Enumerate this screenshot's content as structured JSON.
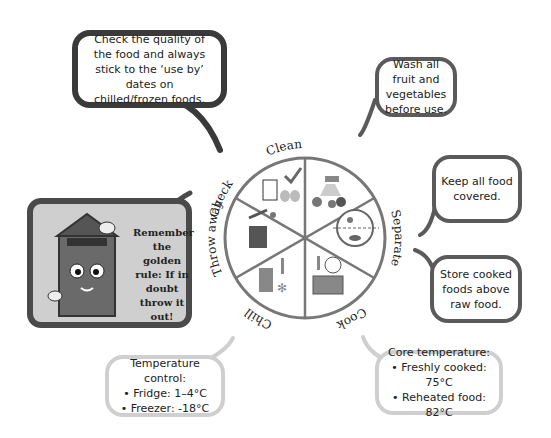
{
  "wheel": {
    "segments": [
      {
        "label": "Check",
        "icon": "milk-eggs-check-icon"
      },
      {
        "label": "Clean",
        "icon": "tap-vegetables-icon"
      },
      {
        "label": "Separate",
        "icon": "separated-plate-icon"
      },
      {
        "label": "Cook",
        "icon": "microwave-clock-thermometer-icon"
      },
      {
        "label": "Chill",
        "icon": "fridge-snowflake-thermometer-icon"
      },
      {
        "label": "Throw away",
        "icon": "bin-icon"
      }
    ]
  },
  "bubbles": {
    "check": "Check the quality of the food and always stick to the ‘use by’ dates on chilled/frozen foods.",
    "clean": "Wash all fruit and vegetables before use.",
    "separate_1": "Keep all food covered.",
    "separate_2": "Store cooked foods above raw food.",
    "chill": {
      "title": "Temperature control:",
      "items": [
        "• Fridge: 1–4°C",
        "• Freezer: -18°C"
      ]
    },
    "cook": {
      "title": "Core temperature:",
      "items": [
        "• Freshly cooked: 75°C",
        "• Reheated food: 82°C"
      ]
    },
    "throw_away": "Remember the golden rule: If in doubt throw it out!"
  },
  "colors": {
    "dark_outline": "#3a3a3a",
    "mid_outline": "#5a5a5a",
    "light_outline": "#cfcfcf",
    "wheel_line": "#7a7a7a"
  }
}
